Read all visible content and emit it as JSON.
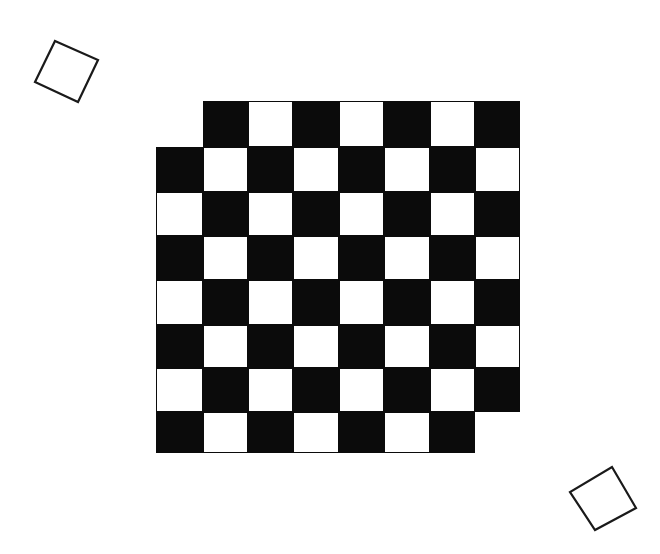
{
  "scene": {
    "description": "Mutilated-style checkerboard with two rotated outline squares",
    "background": "#ffffff",
    "ink_color": "#0b0b0b"
  },
  "board": {
    "colors": {
      "dark": "#0b0b0b",
      "light": "#ffffff"
    },
    "row_bounds_y": [
      101,
      147,
      192,
      236,
      280,
      325,
      368,
      412,
      453
    ],
    "col_bounds_x": [
      156,
      203,
      248,
      293,
      339,
      384,
      430,
      475,
      520
    ],
    "rows": [
      {
        "index": 0,
        "cells": [
          "empty",
          "B",
          "W",
          "B",
          "W",
          "B",
          "W",
          "B"
        ]
      },
      {
        "index": 1,
        "cells": [
          "B",
          "W",
          "B",
          "W",
          "B",
          "W",
          "B",
          "W"
        ]
      },
      {
        "index": 2,
        "cells": [
          "W",
          "B",
          "W",
          "B",
          "W",
          "B",
          "W",
          "B"
        ]
      },
      {
        "index": 3,
        "cells": [
          "B",
          "W",
          "B",
          "W",
          "B",
          "W",
          "B",
          "W"
        ]
      },
      {
        "index": 4,
        "cells": [
          "W",
          "B",
          "W",
          "B",
          "W",
          "B",
          "W",
          "B"
        ]
      },
      {
        "index": 5,
        "cells": [
          "B",
          "W",
          "B",
          "W",
          "B",
          "W",
          "B",
          "W"
        ]
      },
      {
        "index": 6,
        "cells": [
          "W",
          "B",
          "W",
          "B",
          "W",
          "B",
          "W",
          "B"
        ]
      },
      {
        "index": 7,
        "cells": [
          "B",
          "W",
          "B",
          "W",
          "B",
          "W",
          "B",
          "empty"
        ]
      }
    ]
  },
  "markers": [
    {
      "name": "rotated-square-top-left",
      "points": "55,41 98,60 78,102 35,82",
      "stroke": "#1a1a1a"
    },
    {
      "name": "rotated-square-bottom-right",
      "points": "612,467 636,508 595,530 570,492",
      "stroke": "#1a1a1a"
    }
  ]
}
